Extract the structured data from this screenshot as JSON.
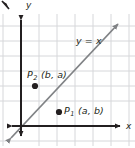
{
  "figure": {
    "background_color": "#ffffff",
    "ink_color": "#231f20",
    "grid_color": "#d6d7da",
    "line_color": "#808285",
    "axis_color": "#231f20"
  },
  "axes": {
    "x_label": "x",
    "y_label": "y",
    "x_axis_name": "x-axis",
    "y_axis_name": "y-axis",
    "origin_px": {
      "x": 21,
      "y": 126
    },
    "x_axis_arrow_right_px": {
      "x": 124,
      "y": 126
    },
    "x_axis_arrow_left_px": {
      "x": 8,
      "y": 126
    },
    "y_axis_arrow_up_px": {
      "x": 21,
      "y": 14
    },
    "y_axis_arrow_down_px": {
      "x": 21,
      "y": 140
    }
  },
  "grid": {
    "visible": true,
    "vertical_lines_x_px": [
      3,
      21,
      39,
      57,
      75,
      93,
      111,
      129
    ],
    "horizontal_lines_y_px": [
      26,
      41,
      56,
      71,
      86,
      101,
      126,
      141
    ],
    "spacing_px": 18
  },
  "line": {
    "equation_label": "y = x",
    "name": "line-y-equals-x",
    "from_px": {
      "x": 7,
      "y": 142
    },
    "to_px": {
      "x": 121,
      "y": 21
    },
    "has_arrow_start": true,
    "has_arrow_end": true,
    "slope": 1,
    "intercept": 0
  },
  "points": [
    {
      "id": "P1",
      "name": "point-p1",
      "label_base": "P",
      "label_subscript": "1",
      "coordinates_text": "(a, b)",
      "full_label": "P1 (a, b)",
      "dot_px": {
        "x": 59,
        "y": 112
      },
      "label_px": {
        "x": 64,
        "y": 106
      },
      "dot_radius_px": 3
    },
    {
      "id": "P2",
      "name": "point-p2",
      "label_base": "P",
      "label_subscript": "2",
      "coordinates_text": "(b, a)",
      "full_label": "P2 (b, a)",
      "dot_px": {
        "x": 35,
        "y": 86
      },
      "label_px": {
        "x": 27,
        "y": 70
      },
      "dot_radius_px": 3
    }
  ],
  "corner_mark": {
    "name": "corner-arrow-mark",
    "visible": true,
    "position_px": {
      "x": 2,
      "y": 2
    }
  }
}
